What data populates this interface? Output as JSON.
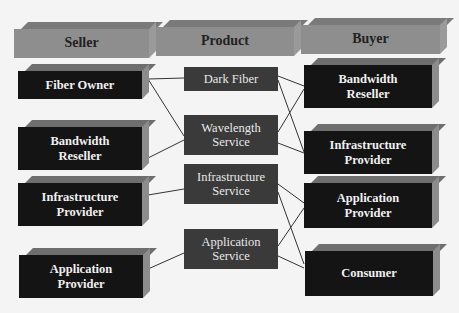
{
  "headers": {
    "seller": "Seller",
    "product": "Product",
    "buyer": "Buyer"
  },
  "sellers": [
    {
      "id": "s1",
      "label_line1": "Fiber Owner",
      "label_line2": ""
    },
    {
      "id": "s2",
      "label_line1": "Bandwidth",
      "label_line2": "Reseller"
    },
    {
      "id": "s3",
      "label_line1": "Infrastructure",
      "label_line2": "Provider"
    },
    {
      "id": "s4",
      "label_line1": "Application",
      "label_line2": "Provider"
    }
  ],
  "products": [
    {
      "id": "p1",
      "label_line1": "Dark Fiber",
      "label_line2": ""
    },
    {
      "id": "p2",
      "label_line1": "Wavelength",
      "label_line2": "Service"
    },
    {
      "id": "p3",
      "label_line1": "Infrastructure",
      "label_line2": "Service"
    },
    {
      "id": "p4",
      "label_line1": "Application",
      "label_line2": "Service"
    }
  ],
  "buyers": [
    {
      "id": "b1",
      "label_line1": "Bandwidth",
      "label_line2": "Reseller"
    },
    {
      "id": "b2",
      "label_line1": "Infrastructure",
      "label_line2": "Provider"
    },
    {
      "id": "b3",
      "label_line1": "Application",
      "label_line2": "Provider"
    },
    {
      "id": "b4",
      "label_line1": "Consumer",
      "label_line2": ""
    }
  ],
  "connections": [
    {
      "from": "Fiber Owner",
      "to": "Dark Fiber"
    },
    {
      "from": "Fiber Owner",
      "to": "Wavelength Service"
    },
    {
      "from": "Bandwidth Reseller (seller)",
      "to": "Wavelength Service"
    },
    {
      "from": "Infrastructure Provider (seller)",
      "to": "Infrastructure Service"
    },
    {
      "from": "Application Provider (seller)",
      "to": "Application Service"
    },
    {
      "from": "Dark Fiber",
      "to": "Bandwidth Reseller (buyer)"
    },
    {
      "from": "Dark Fiber",
      "to": "Infrastructure Provider (buyer)"
    },
    {
      "from": "Wavelength Service",
      "to": "Bandwidth Reseller (buyer)"
    },
    {
      "from": "Wavelength Service",
      "to": "Infrastructure Provider (buyer)"
    },
    {
      "from": "Infrastructure Service",
      "to": "Application Provider (buyer)"
    },
    {
      "from": "Infrastructure Service",
      "to": "Consumer"
    },
    {
      "from": "Application Service",
      "to": "Application Provider (buyer)"
    },
    {
      "from": "Application Service",
      "to": "Consumer"
    }
  ],
  "colors": {
    "background": "#f4f4f4",
    "header_face": "#8e8e8e",
    "actor_face": "#141414",
    "product_face": "#3a3a3a",
    "line": "#333333"
  }
}
